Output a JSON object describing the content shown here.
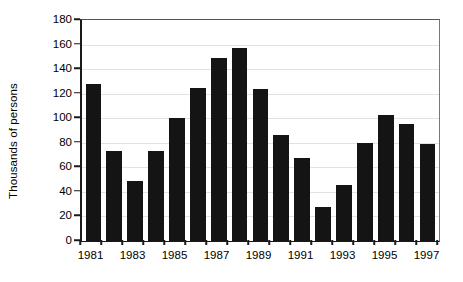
{
  "chart_data": {
    "type": "bar",
    "title": "",
    "subtitle": "",
    "xlabel": "",
    "ylabel": "Thousands of persons",
    "ylim": [
      0,
      180
    ],
    "yticks": [
      0,
      20,
      40,
      60,
      80,
      100,
      120,
      140,
      160,
      180
    ],
    "ytick_labels": [
      "0",
      "20",
      "40",
      "60",
      "80",
      "100",
      "120",
      "140",
      "160",
      "180"
    ],
    "grid": true,
    "legend": null,
    "legend_position": "none",
    "bar_color": "#141414",
    "categories": [
      "1981",
      "1982",
      "1983",
      "1984",
      "1985",
      "1986",
      "1987",
      "1988",
      "1989",
      "1990",
      "1991",
      "1992",
      "1993",
      "1994",
      "1995",
      "1996",
      "1997"
    ],
    "xtick_labels": [
      "1981",
      "1983",
      "1985",
      "1987",
      "1989",
      "1991",
      "1993",
      "1995",
      "1997"
    ],
    "values": [
      128,
      73,
      49,
      73,
      100,
      125,
      149,
      157,
      124,
      86,
      68,
      28,
      46,
      80,
      103,
      95,
      79
    ],
    "annotations": []
  }
}
